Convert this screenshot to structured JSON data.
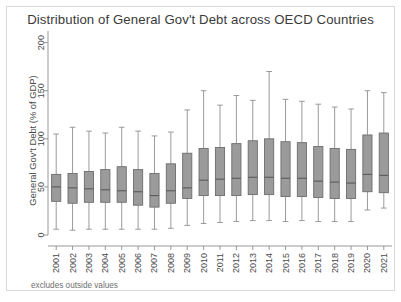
{
  "chart_data": {
    "type": "box",
    "title": "Distribution of General Gov't Debt across OECD Countries",
    "xlabel": "",
    "ylabel": "General Gov't Debt (% of GDP)",
    "footnote": "excludes outside values",
    "ylim": [
      0,
      210
    ],
    "yticks": [
      0,
      50,
      100,
      150,
      200
    ],
    "ytick_labels": [
      "0",
      "50",
      "100",
      "150",
      "200"
    ],
    "grid": false,
    "legend": "none",
    "box_fill": "#9b9b9b",
    "box_stroke": "#6d6d6d",
    "whisker_color": "#8f8f8f",
    "median_color": "#5a5a5a",
    "axis_color": "#8c8c8c",
    "categories": [
      "2001",
      "2002",
      "2003",
      "2004",
      "2005",
      "2006",
      "2007",
      "2008",
      "2009",
      "2010",
      "2011",
      "2012",
      "2013",
      "2014",
      "2015",
      "2016",
      "2017",
      "2018",
      "2019",
      "2020",
      "2021"
    ],
    "boxes": [
      {
        "category": "2001",
        "whisker_low": 6,
        "q1": 35,
        "median": 50,
        "q3": 63,
        "whisker_high": 105
      },
      {
        "category": "2002",
        "whisker_low": 5,
        "q1": 33,
        "median": 49,
        "q3": 64,
        "whisker_high": 112
      },
      {
        "category": "2003",
        "whisker_low": 6,
        "q1": 34,
        "median": 48,
        "q3": 66,
        "whisker_high": 108
      },
      {
        "category": "2004",
        "whisker_low": 6,
        "q1": 34,
        "median": 47,
        "q3": 68,
        "whisker_high": 106
      },
      {
        "category": "2005",
        "whisker_low": 6,
        "q1": 34,
        "median": 46,
        "q3": 71,
        "whisker_high": 112
      },
      {
        "category": "2006",
        "whisker_low": 6,
        "q1": 31,
        "median": 45,
        "q3": 68,
        "whisker_high": 108
      },
      {
        "category": "2007",
        "whisker_low": 6,
        "q1": 29,
        "median": 41,
        "q3": 64,
        "whisker_high": 103
      },
      {
        "category": "2008",
        "whisker_low": 7,
        "q1": 33,
        "median": 46,
        "q3": 74,
        "whisker_high": 107
      },
      {
        "category": "2009",
        "whisker_low": 10,
        "q1": 38,
        "median": 49,
        "q3": 85,
        "whisker_high": 130
      },
      {
        "category": "2010",
        "whisker_low": 12,
        "q1": 41,
        "median": 57,
        "q3": 90,
        "whisker_high": 150
      },
      {
        "category": "2011",
        "whisker_low": 13,
        "q1": 41,
        "median": 58,
        "q3": 91,
        "whisker_high": 135
      },
      {
        "category": "2012",
        "whisker_low": 14,
        "q1": 41,
        "median": 59,
        "q3": 95,
        "whisker_high": 145
      },
      {
        "category": "2013",
        "whisker_low": 15,
        "q1": 42,
        "median": 60,
        "q3": 98,
        "whisker_high": 140
      },
      {
        "category": "2014",
        "whisker_low": 15,
        "q1": 42,
        "median": 60,
        "q3": 100,
        "whisker_high": 170
      },
      {
        "category": "2015",
        "whisker_low": 14,
        "q1": 40,
        "median": 59,
        "q3": 97,
        "whisker_high": 141
      },
      {
        "category": "2016",
        "whisker_low": 15,
        "q1": 40,
        "median": 59,
        "q3": 96,
        "whisker_high": 139
      },
      {
        "category": "2017",
        "whisker_low": 14,
        "q1": 39,
        "median": 56,
        "q3": 92,
        "whisker_high": 136
      },
      {
        "category": "2018",
        "whisker_low": 14,
        "q1": 38,
        "median": 55,
        "q3": 90,
        "whisker_high": 133
      },
      {
        "category": "2019",
        "whisker_low": 14,
        "q1": 38,
        "median": 54,
        "q3": 89,
        "whisker_high": 131
      },
      {
        "category": "2020",
        "whisker_low": 26,
        "q1": 45,
        "median": 63,
        "q3": 104,
        "whisker_high": 150
      },
      {
        "category": "2021",
        "whisker_low": 28,
        "q1": 44,
        "median": 62,
        "q3": 106,
        "whisker_high": 148
      }
    ]
  }
}
